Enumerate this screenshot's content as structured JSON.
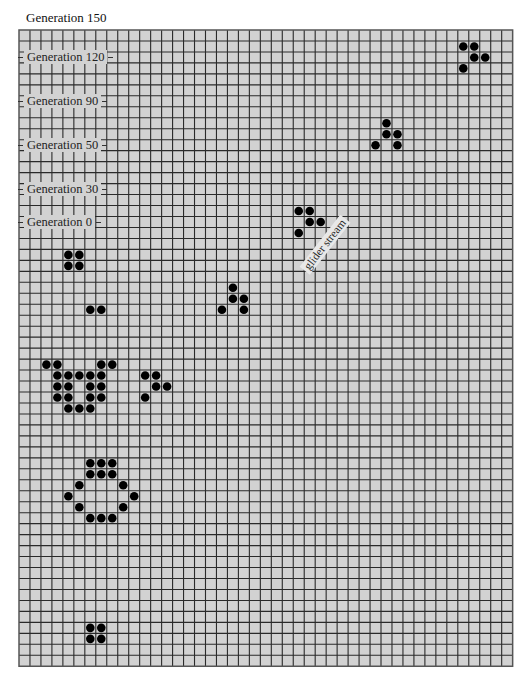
{
  "title": "Generation 150",
  "grid": {
    "cols": 45,
    "rows": 58,
    "cell_size": 10.97,
    "cell_color": "#d2d2d2",
    "line_color": "#2a2a2a",
    "border_color": "#555555",
    "dot_color": "#000000"
  },
  "generation_labels": [
    {
      "text": "Generation 120",
      "row": 2
    },
    {
      "text": "Generation 90",
      "row": 6
    },
    {
      "text": "Generation 50",
      "row": 10
    },
    {
      "text": "Generation 30",
      "row": 14
    },
    {
      "text": "Generation 0",
      "row": 17
    }
  ],
  "annotation": {
    "text": "glider stream",
    "angle": -52
  },
  "live_cells": [
    [
      40,
      1
    ],
    [
      41,
      1
    ],
    [
      41,
      2
    ],
    [
      42,
      2
    ],
    [
      40,
      3
    ],
    [
      33,
      8
    ],
    [
      33,
      9
    ],
    [
      34,
      9
    ],
    [
      32,
      10
    ],
    [
      34,
      10
    ],
    [
      25,
      16
    ],
    [
      26,
      16
    ],
    [
      26,
      17
    ],
    [
      27,
      17
    ],
    [
      25,
      18
    ],
    [
      19,
      23
    ],
    [
      19,
      24
    ],
    [
      20,
      24
    ],
    [
      18,
      25
    ],
    [
      20,
      25
    ],
    [
      4,
      20
    ],
    [
      5,
      20
    ],
    [
      4,
      21
    ],
    [
      5,
      21
    ],
    [
      6,
      25
    ],
    [
      7,
      25
    ],
    [
      2,
      30
    ],
    [
      3,
      30
    ],
    [
      7,
      30
    ],
    [
      8,
      30
    ],
    [
      3,
      31
    ],
    [
      4,
      31
    ],
    [
      5,
      31
    ],
    [
      6,
      31
    ],
    [
      7,
      31
    ],
    [
      3,
      32
    ],
    [
      4,
      32
    ],
    [
      6,
      32
    ],
    [
      7,
      32
    ],
    [
      3,
      33
    ],
    [
      4,
      33
    ],
    [
      6,
      33
    ],
    [
      7,
      33
    ],
    [
      4,
      34
    ],
    [
      5,
      34
    ],
    [
      6,
      34
    ],
    [
      11,
      31
    ],
    [
      12,
      31
    ],
    [
      12,
      32
    ],
    [
      13,
      32
    ],
    [
      11,
      33
    ],
    [
      6,
      39
    ],
    [
      7,
      39
    ],
    [
      8,
      39
    ],
    [
      6,
      40
    ],
    [
      7,
      40
    ],
    [
      8,
      40
    ],
    [
      5,
      41
    ],
    [
      9,
      41
    ],
    [
      4,
      42
    ],
    [
      10,
      42
    ],
    [
      5,
      43
    ],
    [
      9,
      43
    ],
    [
      6,
      44
    ],
    [
      7,
      44
    ],
    [
      8,
      44
    ],
    [
      6,
      54
    ],
    [
      7,
      54
    ],
    [
      6,
      55
    ],
    [
      7,
      55
    ]
  ]
}
